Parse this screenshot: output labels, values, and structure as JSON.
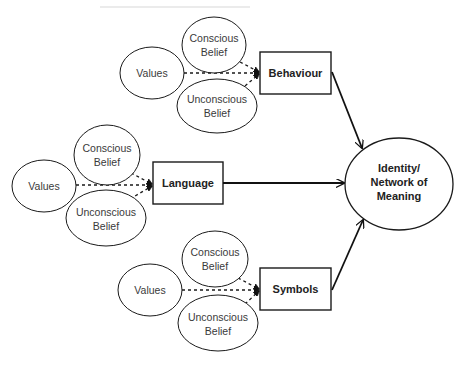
{
  "diagram": {
    "groups": [
      {
        "id": "behaviour",
        "values_label": "Values",
        "conscious_label": [
          "Conscious",
          "Belief"
        ],
        "unconscious_label": [
          "Unconscious",
          "Belief"
        ],
        "target_label": "Behaviour"
      },
      {
        "id": "language",
        "values_label": "Values",
        "conscious_label": [
          "Conscious",
          "Belief"
        ],
        "unconscious_label": [
          "Unconscious",
          "Belief"
        ],
        "target_label": "Language"
      },
      {
        "id": "symbols",
        "values_label": "Values",
        "conscious_label": [
          "Conscious",
          "Belief"
        ],
        "unconscious_label": [
          "Unconscious",
          "Belief"
        ],
        "target_label": "Symbols"
      }
    ],
    "outcome": {
      "label": [
        "Identity/",
        "Network of",
        "Meaning"
      ]
    },
    "edges": [
      {
        "from": "Values",
        "to": "Behaviour",
        "style": "dashed"
      },
      {
        "from": "Conscious Belief",
        "to": "Behaviour",
        "style": "dashed"
      },
      {
        "from": "Unconscious Belief",
        "to": "Behaviour",
        "style": "dashed"
      },
      {
        "from": "Values",
        "to": "Language",
        "style": "dashed"
      },
      {
        "from": "Conscious Belief",
        "to": "Language",
        "style": "dashed"
      },
      {
        "from": "Unconscious Belief",
        "to": "Language",
        "style": "dashed"
      },
      {
        "from": "Values",
        "to": "Symbols",
        "style": "dashed"
      },
      {
        "from": "Conscious Belief",
        "to": "Symbols",
        "style": "dashed"
      },
      {
        "from": "Unconscious Belief",
        "to": "Symbols",
        "style": "dashed"
      },
      {
        "from": "Behaviour",
        "to": "Identity/Network of Meaning",
        "style": "solid"
      },
      {
        "from": "Language",
        "to": "Identity/Network of Meaning",
        "style": "solid"
      },
      {
        "from": "Symbols",
        "to": "Identity/Network of Meaning",
        "style": "solid"
      }
    ]
  }
}
